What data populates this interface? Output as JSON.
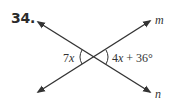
{
  "problem": {
    "number": "34.",
    "lines": [
      {
        "name": "m",
        "label": "m"
      },
      {
        "name": "n",
        "label": "n"
      }
    ],
    "angles": {
      "left": {
        "var": "7",
        "x": "x"
      },
      "right": {
        "coef": "4",
        "x": "x",
        "rest": " + 36°"
      }
    }
  },
  "colors": {
    "line": "#333333",
    "text": "#2b2b2b"
  }
}
